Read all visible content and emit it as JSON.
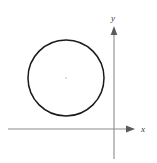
{
  "figure": {
    "name": "circle-with-coordinate-axes",
    "width": 157,
    "height": 163,
    "background_color": "#ffffff"
  },
  "colors": {
    "curve_stroke": "#1a1a1a",
    "axis_stroke": "#8c8c8c",
    "label_text": "#3a3a3a",
    "center_mark": "#d8d8d8"
  },
  "axes": {
    "x_axis": {
      "label": "x",
      "y_position": 129,
      "x_start": 8,
      "x_end": 134,
      "arrow": "right",
      "label_x": 143,
      "label_y": 132
    },
    "y_axis": {
      "label": "y",
      "x_position": 114,
      "y_start": 27,
      "y_end": 159,
      "arrow": "up",
      "label_x": 113,
      "label_y": 21
    },
    "origin": {
      "x": 114,
      "y": 129
    }
  },
  "chart_data": {
    "type": "scatter",
    "title": "",
    "xlabel": "x",
    "ylabel": "y",
    "grid": false,
    "legend": null,
    "shapes": [
      {
        "kind": "circle",
        "center_x": 66,
        "center_y": 78,
        "radius": 38,
        "stroke": "#1a1a1a",
        "stroke_width": 1.5,
        "fill": "none"
      }
    ],
    "annotations": [
      {
        "kind": "center-mark",
        "x": 66,
        "y": 78
      }
    ]
  }
}
